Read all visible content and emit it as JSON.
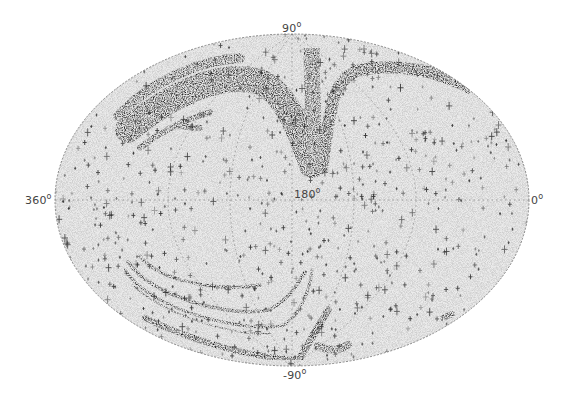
{
  "chart_data": {
    "type": "scatter",
    "projection": "Hammer-Aitoff all-sky (elliptical)",
    "title": "",
    "xlabel": "",
    "ylabel": "",
    "axis_labels": {
      "top": "90",
      "bottom": "-90",
      "left": "360",
      "center": "180",
      "right": "0",
      "degree_symbol": "o"
    },
    "x_range": [
      360,
      0
    ],
    "y_range": [
      -90,
      90
    ],
    "grid": true,
    "grid_style": "dotted",
    "marker": "cross",
    "colors": {
      "background": "#ffffff",
      "sky_fill": "#ececec",
      "points": "#222222",
      "grid": "#888888",
      "outline": "#777777"
    },
    "features": [
      {
        "name": "northern arc (large, left of pole)",
        "density": "high"
      },
      {
        "name": "northern stream (right of pole)",
        "density": "very high"
      },
      {
        "name": "southern concentric arcs",
        "count": 4,
        "density": "high"
      },
      {
        "name": "southern straight band (lower-left)",
        "density": "very high"
      },
      {
        "name": "southern diagonal band (near -90)",
        "density": "very high"
      },
      {
        "name": "scattered background points",
        "density": "low"
      }
    ]
  },
  "labels": {
    "top_value": "90",
    "bottom_value": "-90",
    "left_value": "360",
    "center_value": "180",
    "right_value": "0",
    "deg": "o"
  }
}
